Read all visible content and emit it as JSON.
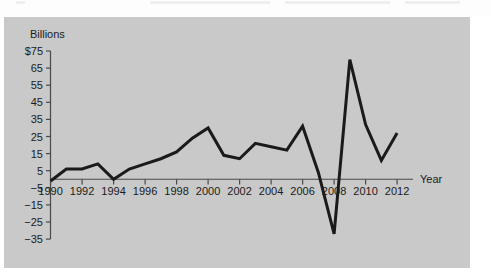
{
  "chart_data": {
    "type": "line",
    "title": "",
    "subtitle": "",
    "unit_label": "Billions",
    "xlabel": "Year",
    "ylabel": "",
    "grid": false,
    "legend": "none",
    "xlim": [
      1990,
      2012
    ],
    "ylim": [
      -35,
      75
    ],
    "ytick_labels": [
      "$75",
      "65",
      "55",
      "45",
      "35",
      "25",
      "15",
      "5",
      "−5",
      "−15",
      "−25",
      "−35"
    ],
    "ytick_values": [
      75,
      65,
      55,
      45,
      35,
      25,
      15,
      5,
      -5,
      -15,
      -25,
      -35
    ],
    "xtick_labels": [
      "1990",
      "1992",
      "1994",
      "1996",
      "1998",
      "2000",
      "2002",
      "2004",
      "2006",
      "2008",
      "2010",
      "2012"
    ],
    "xtick_values": [
      1990,
      1992,
      1994,
      1996,
      1998,
      2000,
      2002,
      2004,
      2006,
      2008,
      2010,
      2012
    ],
    "x": [
      1990,
      1991,
      1992,
      1993,
      1994,
      1995,
      1996,
      1997,
      1998,
      1999,
      2000,
      2001,
      2002,
      2003,
      2004,
      2005,
      2006,
      2007,
      2008,
      2009,
      2010,
      2011,
      2012
    ],
    "values": [
      -1,
      6,
      6,
      9,
      0,
      6,
      9,
      12,
      16,
      24,
      30,
      14,
      12,
      21,
      19,
      17,
      31,
      4,
      -32,
      70,
      32,
      11,
      27
    ],
    "line_color": "#1a1a1a",
    "line_width": 3,
    "panel_color": "#c9c9c9",
    "page_color": "#ffffff"
  }
}
